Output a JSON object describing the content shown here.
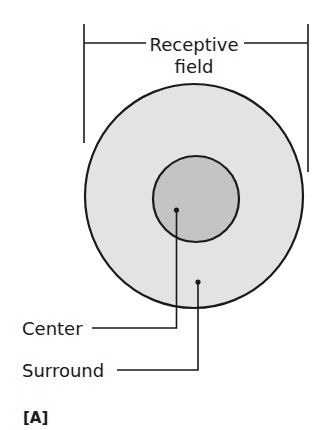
{
  "figure": {
    "title_line1": "Receptive",
    "title_line2": "field",
    "labels": {
      "center": "Center",
      "surround": "Surround"
    },
    "panel_label": "[A]"
  },
  "colors": {
    "stroke": "#1a1a1a",
    "surround_fill": "#e3e3e3",
    "center_fill": "#c4c4c4",
    "background": "#ffffff"
  },
  "geometry": {
    "outer_circle": {
      "cx": 194,
      "cy": 196,
      "r": 110
    },
    "inner_circle": {
      "cx": 196,
      "cy": 199,
      "r": 43
    },
    "bracket": {
      "left_x": 84,
      "right_x": 308,
      "y": 43
    }
  }
}
